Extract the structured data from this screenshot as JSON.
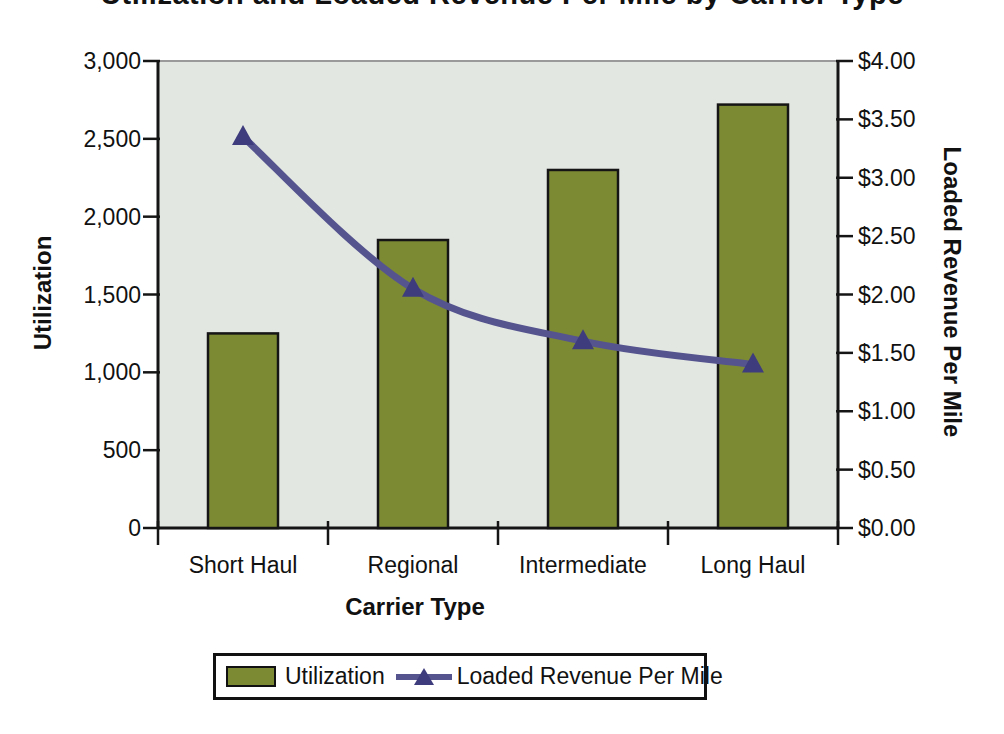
{
  "chart_data": {
    "type": "bar",
    "subtype": "combo-bar-line-dual-axis",
    "title": "Utilization and Loaded Revenue Per Mile by Carrier Type",
    "title_note": "title is clipped by the top edge of the screenshot; only the bottom of the letters is visible",
    "categories": [
      "Short Haul",
      "Regional",
      "Intermediate",
      "Long Haul"
    ],
    "series": [
      {
        "name": "Utilization",
        "type": "bar",
        "axis": "left",
        "values": [
          1250,
          1850,
          2300,
          2720
        ],
        "color": "#7d8a34",
        "border_color": "#151515"
      },
      {
        "name": "Loaded Revenue Per Mile",
        "type": "line",
        "axis": "right",
        "values": [
          3.35,
          2.05,
          1.6,
          1.4
        ],
        "smoothed": true,
        "color": "#55548f",
        "marker": "triangle-up",
        "marker_color": "#3e3c7c"
      }
    ],
    "xlabel": "Carrier Type",
    "left_axis": {
      "label": "Utilization",
      "min": 0,
      "max": 3000,
      "tick_step": 500,
      "tick_labels": [
        "0",
        "500",
        "1,000",
        "1,500",
        "2,000",
        "2,500",
        "3,000"
      ]
    },
    "right_axis": {
      "label": "Loaded Revenue Per Mile",
      "min": 0,
      "max": 4,
      "tick_step": 0.5,
      "tick_labels": [
        "$0.00",
        "$0.50",
        "$1.00",
        "$1.50",
        "$2.00",
        "$2.50",
        "$3.00",
        "$3.50",
        "$4.00"
      ]
    },
    "legend": {
      "position": "bottom",
      "entries": [
        "Utilization",
        "Loaded Revenue Per Mile"
      ]
    },
    "grid": false,
    "plot_bg_color": "#e3e7e2",
    "plot_top_border_color": "#9a9a9a",
    "axis_line_color": "#151515",
    "text_color": "#111111"
  }
}
